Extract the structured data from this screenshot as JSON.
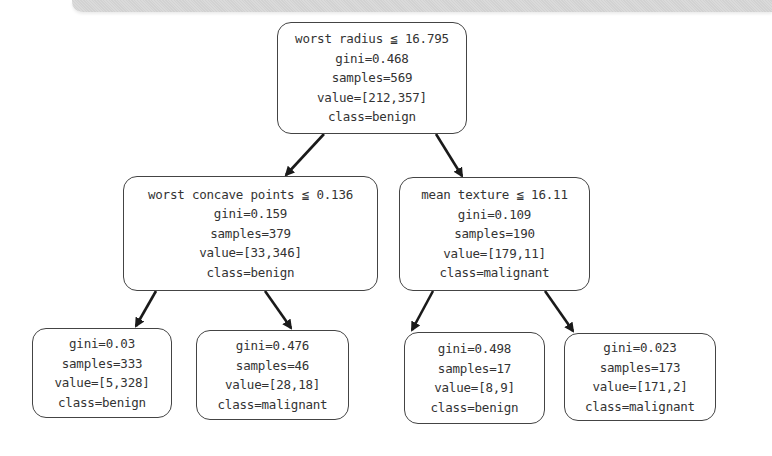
{
  "diagram": {
    "type": "decision-tree",
    "nodes": {
      "root": {
        "split": "worst radius ≦ 16.795",
        "gini": "gini=0.468",
        "samples": "samples=569",
        "value": "value=[212,357]",
        "class": "class=benign"
      },
      "left": {
        "split": "worst concave points ≦ 0.136",
        "gini": "gini=0.159",
        "samples": "samples=379",
        "value": "value=[33,346]",
        "class": "class=benign"
      },
      "right": {
        "split": "mean texture ≦ 16.11",
        "gini": "gini=0.109",
        "samples": "samples=190",
        "value": "value=[179,11]",
        "class": "class=malignant"
      },
      "leaf_ll": {
        "gini": "gini=0.03",
        "samples": "samples=333",
        "value": "value=[5,328]",
        "class": "class=benign"
      },
      "leaf_lr": {
        "gini": "gini=0.476",
        "samples": "samples=46",
        "value": "value=[28,18]",
        "class": "class=malignant"
      },
      "leaf_rl": {
        "gini": "gini=0.498",
        "samples": "samples=17",
        "value": "value=[8,9]",
        "class": "class=benign"
      },
      "leaf_rr": {
        "gini": "gini=0.023",
        "samples": "samples=173",
        "value": "value=[171,2]",
        "class": "class=malignant"
      }
    },
    "colors": {
      "border": "#444444",
      "text": "#333333",
      "edge": "#1a1a1a",
      "background": "#ffffff"
    }
  }
}
